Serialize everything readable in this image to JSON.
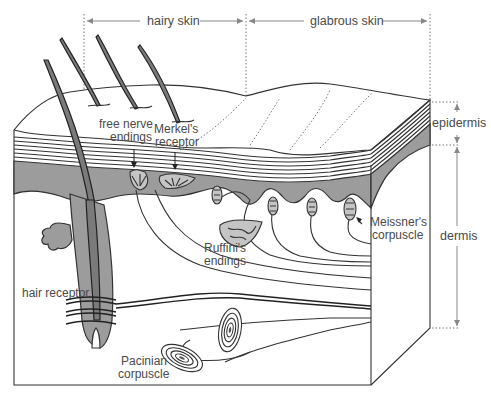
{
  "figure": {
    "regions": {
      "hairy_skin": "hairy skin",
      "glabrous_skin": "glabrous skin"
    },
    "layers": {
      "epidermis": "epidermis",
      "dermis": "dermis"
    },
    "receptors": {
      "free_nerve_endings_line1": "free nerve",
      "free_nerve_endings_line2": "endings",
      "merkel_line1": "Merkel's",
      "merkel_line2": "receptor",
      "meissner_line1": "Meissner's",
      "meissner_line2": "corpuscle",
      "ruffini_line1": "Ruffini's",
      "ruffini_line2": "endings",
      "hair_receptor": "hair receptor",
      "pacinian_line1": "Pacinian",
      "pacinian_line2": "corpuscle"
    },
    "colors": {
      "background": "#ffffff",
      "epidermis_fill": "#9c9c9c",
      "hair_fill": "#7a7a7a",
      "receptor_fill": "#c4c4c4",
      "line": "#222222",
      "label_text": "#4a4a4a",
      "dimension_line": "#888888"
    }
  }
}
